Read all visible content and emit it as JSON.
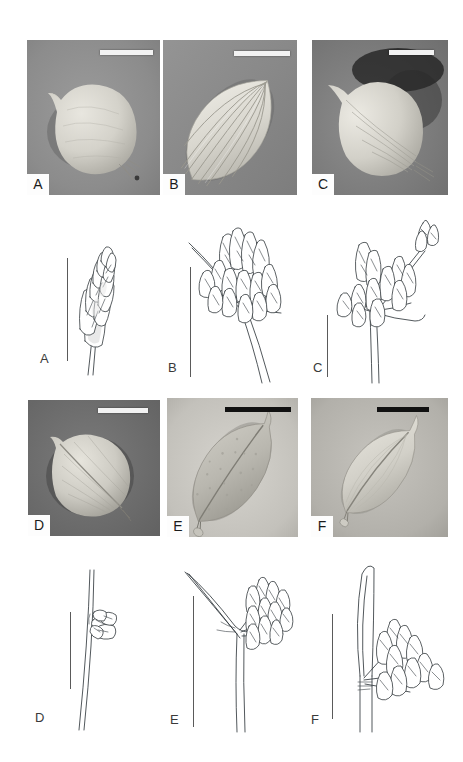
{
  "figure": {
    "kind": "botanical-plate",
    "rows": 4,
    "columns": 3,
    "background_color": "#ffffff"
  },
  "sem_row_top": {
    "row_label": "sem-row-1",
    "panels": [
      {
        "label": "A",
        "specimen_shape": "broadly ovoid-globose nutlet with short apical beak",
        "surface": "smooth, finely granulate",
        "background_tone": "#8e8e8e",
        "specimen_tone": "#d8d6cf",
        "scalebar_color": "#f2f2f2"
      },
      {
        "label": "B",
        "specimen_shape": "ellipsoid nutlet with strong longitudinal ribs",
        "surface": "prominently ribbed / sulcate",
        "background_tone": "#8a8a8a",
        "specimen_tone": "#dcdad3",
        "scalebar_color": "#f2f2f2"
      },
      {
        "label": "C",
        "specimen_shape": "obovoid nutlet, beaked, faintly ribbed",
        "surface": "finely striate",
        "background_tone": "#7e7e7e",
        "specimen_tone": "#d4d2cb",
        "scalebar_color": "#f2f2f2"
      }
    ]
  },
  "draw_row_upper": {
    "row_label": "drawing-row-1",
    "panels": [
      {
        "label": "A",
        "subject": "single terminal spikelet on slender culm",
        "scalebar_orientation": "vertical"
      },
      {
        "label": "B",
        "subject": "umbellate inflorescence, several sessile spikelet clusters, stout culm",
        "scalebar_orientation": "vertical"
      },
      {
        "label": "C",
        "subject": "inflorescence with one long-pedunculate spikelet cluster and sessile clusters",
        "scalebar_orientation": "vertical"
      }
    ]
  },
  "sem_row_bottom": {
    "row_label": "sem-row-2",
    "panels": [
      {
        "label": "D",
        "specimen_shape": "subglobose nutlet with median ridge",
        "surface": "minutely reticulate",
        "background_tone": "#6f6f6f",
        "specimen_tone": "#cfcdc6",
        "scalebar_color": "#f5f5f5"
      },
      {
        "label": "E",
        "specimen_shape": "large ellipsoid-fusiform nutlet, apiculate",
        "surface": "coarsely papillate-punctate",
        "background_tone": "#c9c7c1",
        "specimen_tone": "#b9b7ae",
        "scalebar_color": "#111111"
      },
      {
        "label": "F",
        "specimen_shape": "narrowly ellipsoid nutlet with keeled face",
        "surface": "smooth, faintly striate",
        "background_tone": "#b4b2ac",
        "specimen_tone": "#d6d4cd",
        "scalebar_color": "#111111"
      }
    ]
  },
  "draw_row_lower": {
    "row_label": "drawing-row-2",
    "panels": [
      {
        "label": "D",
        "subject": "slender erect culm with a single small lateral spikelet cluster",
        "scalebar_orientation": "vertical"
      },
      {
        "label": "E",
        "subject": "culm with recurved involucral bract and dense lateral spikelet head",
        "scalebar_orientation": "vertical"
      },
      {
        "label": "F",
        "subject": "stout culm with erect bract and two spreading spikelet clusters",
        "scalebar_orientation": "vertical"
      }
    ]
  }
}
